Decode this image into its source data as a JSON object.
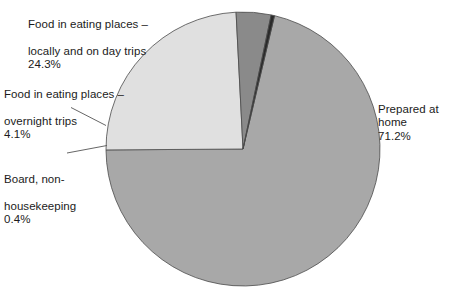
{
  "chart_data": {
    "type": "pie",
    "title": "",
    "categories": [
      "Prepared at home",
      "Food in eating places – locally and on day trips",
      "Food in eating places – overnight trips",
      "Board, non-housekeeping"
    ],
    "values": [
      71.2,
      24.3,
      4.1,
      0.4
    ],
    "value_labels": [
      "71.2%",
      "24.3%",
      "4.1%",
      "0.4%"
    ],
    "unit": "%",
    "colors": [
      "#a8a8a8",
      "#e0e0e0",
      "#8a8a8a",
      "#2a2a2a"
    ],
    "legend": "none",
    "labels_position": "outside-with-leader-lines",
    "start_angle_deg": 13.3,
    "direction": "clockwise",
    "grid": false
  },
  "labels": {
    "locally": {
      "line1": "Food in eating places –",
      "line2": "locally and on day trips",
      "pct": "24.3%"
    },
    "overnight": {
      "line1": "Food in eating places –",
      "line2": "overnight trips",
      "pct": "4.1%"
    },
    "board": {
      "line1": "Board, non-",
      "line2": "housekeeping",
      "pct": "0.4%"
    },
    "home": {
      "line1": "Prepared at home",
      "pct": "71.2%"
    }
  },
  "style": {
    "background": "#ffffff",
    "text_color": "#1b1b1b",
    "slice_outline": "#4a4a4a",
    "leader_line_color": "#555555"
  }
}
